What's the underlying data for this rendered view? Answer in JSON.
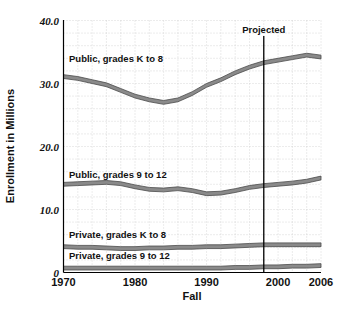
{
  "chart_data": {
    "type": "line",
    "title": "",
    "xlabel": "Fall",
    "ylabel": "Enrollment in Millions",
    "xlim": [
      1970,
      2006
    ],
    "ylim": [
      0,
      40
    ],
    "grid": true,
    "legend_position": "inline-labels",
    "y_ticks": [
      "0",
      "10.0",
      "20.0",
      "30.0",
      "40.0"
    ],
    "y_tick_values": [
      0,
      10,
      20,
      30,
      40
    ],
    "x_ticks": [
      "1970",
      "1980",
      "1990",
      "2000",
      "2006"
    ],
    "x_tick_values": [
      1970,
      1980,
      1990,
      2000,
      2006
    ],
    "annotations": [
      {
        "label": "Projected",
        "x": 1998,
        "type": "vertical-divider"
      }
    ],
    "x": [
      1970,
      1972,
      1974,
      1976,
      1978,
      1980,
      1982,
      1984,
      1986,
      1988,
      1990,
      1992,
      1994,
      1996,
      1998,
      2000,
      2002,
      2004,
      2006
    ],
    "series": [
      {
        "name": "Public, grades K to 8",
        "label": "Public, grades K to 8",
        "values": [
          31.1,
          30.8,
          30.3,
          29.8,
          28.9,
          28.0,
          27.4,
          27.0,
          27.4,
          28.4,
          29.7,
          30.6,
          31.7,
          32.6,
          33.3,
          33.7,
          34.1,
          34.5,
          34.2
        ]
      },
      {
        "name": "Public, grades 9 to 12",
        "label": "Public, grades 9 to 12",
        "values": [
          14.0,
          14.1,
          14.2,
          14.3,
          14.1,
          13.6,
          13.2,
          13.1,
          13.3,
          13.0,
          12.5,
          12.6,
          13.0,
          13.5,
          13.8,
          14.0,
          14.2,
          14.5,
          15.0
        ]
      },
      {
        "name": "Private, grades K to 8",
        "label": "Private, grades K to 8",
        "values": [
          4.1,
          4.0,
          4.0,
          3.9,
          3.8,
          3.8,
          3.9,
          3.9,
          4.0,
          4.0,
          4.1,
          4.1,
          4.2,
          4.3,
          4.4,
          4.4,
          4.4,
          4.4,
          4.4
        ]
      },
      {
        "name": "Private, grades 9 to 12",
        "label": "Private, grades 9 to 12",
        "values": [
          0.7,
          0.7,
          0.7,
          0.7,
          0.7,
          0.7,
          0.7,
          0.7,
          0.7,
          0.7,
          0.7,
          0.7,
          0.8,
          0.8,
          0.9,
          0.9,
          1.0,
          1.0,
          1.1
        ]
      }
    ],
    "series_label_positions": [
      {
        "text": "Public, grades K to 8",
        "x": 69,
        "y": 62
      },
      {
        "text": "Public, grades 9 to 12",
        "x": 69,
        "y": 178
      },
      {
        "text": "Private, grades K to 8",
        "x": 69,
        "y": 238
      },
      {
        "text": "Private, grades 9 to 12",
        "x": 69,
        "y": 259
      }
    ],
    "colors": {
      "series_fill": "#8a8a8a",
      "series_stroke": "#4a4a4a",
      "grid": "#c9c9c9",
      "axis": "#000000",
      "text": "#111111",
      "background": "#ffffff"
    }
  }
}
